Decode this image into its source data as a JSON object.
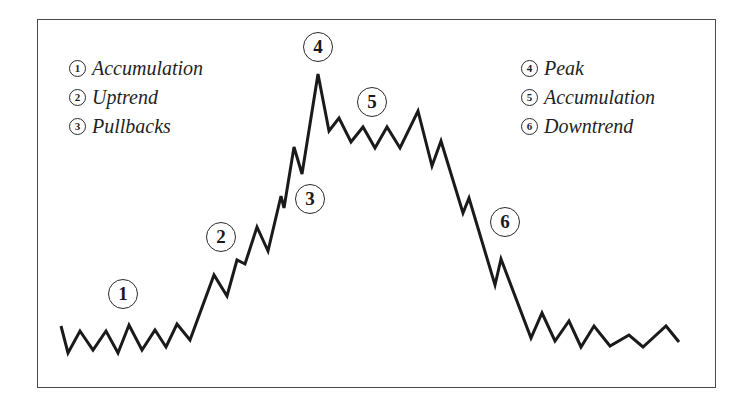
{
  "diagram": {
    "legend_left": [
      {
        "num": "1",
        "label": "Accumulation"
      },
      {
        "num": "2",
        "label": "Uptrend"
      },
      {
        "num": "3",
        "label": "Pullbacks"
      }
    ],
    "legend_right": [
      {
        "num": "4",
        "label": "Peak"
      },
      {
        "num": "5",
        "label": "Accumulation"
      },
      {
        "num": "6",
        "label": "Downtrend"
      }
    ],
    "markers": [
      {
        "num": "1",
        "x": 123,
        "y": 294
      },
      {
        "num": "2",
        "x": 221,
        "y": 237
      },
      {
        "num": "3",
        "x": 310,
        "y": 199
      },
      {
        "num": "4",
        "x": 318,
        "y": 47
      },
      {
        "num": "5",
        "x": 372,
        "y": 102
      },
      {
        "num": "6",
        "x": 505,
        "y": 222
      }
    ],
    "price_path": [
      [
        61,
        326
      ],
      [
        68,
        353
      ],
      [
        80,
        331
      ],
      [
        93,
        350
      ],
      [
        106,
        331
      ],
      [
        118,
        353
      ],
      [
        129,
        325
      ],
      [
        142,
        350
      ],
      [
        155,
        330
      ],
      [
        166,
        347
      ],
      [
        177,
        324
      ],
      [
        190,
        340
      ],
      [
        214,
        275
      ],
      [
        227,
        296
      ],
      [
        237,
        260
      ],
      [
        245,
        264
      ],
      [
        257,
        227
      ],
      [
        268,
        251
      ],
      [
        281,
        196
      ],
      [
        284,
        208
      ],
      [
        294,
        147
      ],
      [
        302,
        174
      ],
      [
        318,
        74
      ],
      [
        329,
        131
      ],
      [
        339,
        118
      ],
      [
        351,
        142
      ],
      [
        363,
        127
      ],
      [
        375,
        148
      ],
      [
        387,
        127
      ],
      [
        400,
        148
      ],
      [
        418,
        111
      ],
      [
        432,
        166
      ],
      [
        441,
        141
      ],
      [
        463,
        213
      ],
      [
        469,
        198
      ],
      [
        495,
        285
      ],
      [
        501,
        259
      ],
      [
        531,
        338
      ],
      [
        542,
        313
      ],
      [
        555,
        341
      ],
      [
        569,
        321
      ],
      [
        581,
        347
      ],
      [
        594,
        326
      ],
      [
        610,
        346
      ],
      [
        629,
        335
      ],
      [
        643,
        347
      ],
      [
        666,
        326
      ],
      [
        679,
        342
      ]
    ],
    "colors": {
      "line": "#1a1a1a",
      "frame": "#4a4a4a",
      "background": "#ffffff"
    }
  }
}
